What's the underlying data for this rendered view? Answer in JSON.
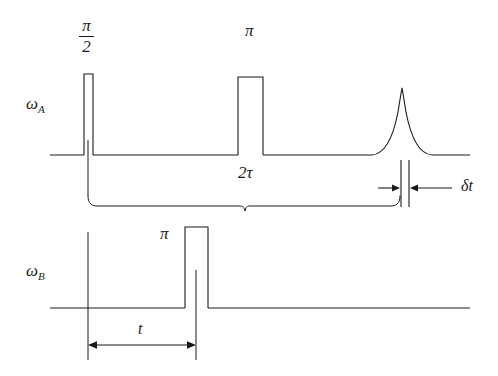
{
  "figure": {
    "type": "pulse-sequence-timing-diagram",
    "background_color": "#ffffff",
    "line_color": "#1a1a1a",
    "channels": [
      {
        "id": "omega-a",
        "label": "ω",
        "subscript": "A",
        "label_x": 26,
        "label_y": 96,
        "baseline_y": 155,
        "baseline_x_start": 50,
        "baseline_x_end": 470,
        "pulses": [
          {
            "name": "pi-over-2-pulse",
            "label_type": "fraction",
            "numerator": "π",
            "denominator": "2",
            "label_x": 80,
            "label_y": 18,
            "x_left": 84,
            "x_right": 93,
            "top_y": 74
          },
          {
            "name": "pi-pulse",
            "label_type": "plain",
            "label": "π",
            "label_x": 245,
            "label_y": 24,
            "x_left": 238,
            "x_right": 263,
            "top_y": 77
          }
        ],
        "echo": {
          "name": "echo-peak",
          "apex_x": 402,
          "apex_y": 88,
          "width": 60
        }
      },
      {
        "id": "omega-b",
        "label": "ω",
        "subscript": "B",
        "label_x": 26,
        "label_y": 263,
        "baseline_y": 308,
        "baseline_x_start": 50,
        "baseline_x_end": 470,
        "pulses": [
          {
            "name": "pi-pulse",
            "label_type": "plain",
            "label": "π",
            "label_x": 160,
            "label_y": 227,
            "x_left": 185,
            "x_right": 208,
            "top_y": 227
          }
        ]
      }
    ],
    "annotations": [
      {
        "name": "two-tau-interval",
        "label": "2τ",
        "label_x": 238,
        "label_y": 166,
        "brace_x_start": 88,
        "brace_x_end": 400,
        "brace_y": 197
      },
      {
        "name": "delta-t-interval",
        "label": "δt",
        "label_x": 461,
        "label_y": 179,
        "marker_line_1_x": 401,
        "marker_line_2_x": 409,
        "arrow_y": 188
      },
      {
        "name": "t-interval",
        "label": "t",
        "label_x": 138,
        "label_y": 322,
        "arrow_x_start": 88,
        "arrow_x_end": 196,
        "arrow_y": 345
      }
    ]
  }
}
